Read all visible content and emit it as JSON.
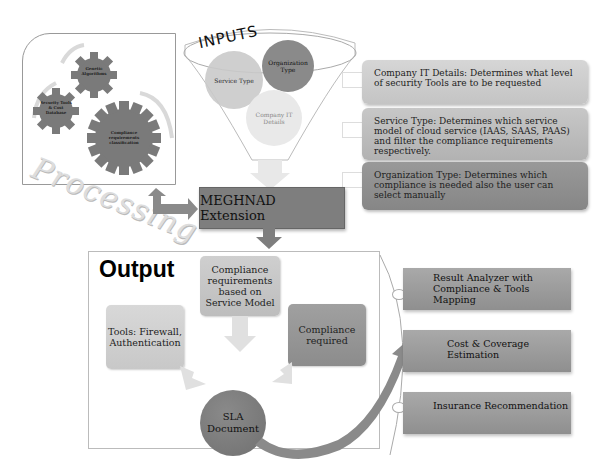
{
  "caption": "Figure: MEGHNAD Extension Workflow",
  "processing": {
    "title": "Processing",
    "gears": [
      {
        "label": "Genetic Algorithms"
      },
      {
        "label": "Security Tools & Cost Database"
      },
      {
        "label": "Compliance requirements classification"
      }
    ]
  },
  "inputs": {
    "title": "INPUTS",
    "circles": [
      {
        "label": "Service Type",
        "color": "#c9c9c9"
      },
      {
        "label": "Organization Type",
        "color": "#8a8a8a"
      },
      {
        "label": "Company IT Details",
        "color": "#e6e6e6"
      }
    ]
  },
  "info_boxes": [
    {
      "text": "Company IT Details: Determines what level of security Tools are to be requested"
    },
    {
      "text": "Service Type: Determines which service model of cloud service (IAAS, SAAS, PAAS) and filter the compliance requirements respectively."
    },
    {
      "text": "Organization Type: Determines which compliance is needed also the user can select manually"
    }
  ],
  "extension": {
    "label": "MEGHNAD Extension"
  },
  "output": {
    "title": "Output",
    "boxes": [
      {
        "label": "Compliance requirements based on Service Model"
      },
      {
        "label": "Tools: Firewall, Authentication"
      },
      {
        "label": "Compliance required"
      }
    ],
    "sla": {
      "label": "SLA Document"
    }
  },
  "results": [
    {
      "label": "Result Analyzer with Compliance & Tools Mapping"
    },
    {
      "label": "Cost & Coverage Estimation"
    },
    {
      "label": "Insurance Recommendation"
    }
  ],
  "colors": {
    "dark_gray": "#7e7e7e",
    "mid_gray": "#a9a9a9",
    "light_gray": "#d6d6d6",
    "arrow_gray": "#8a8a8a"
  }
}
